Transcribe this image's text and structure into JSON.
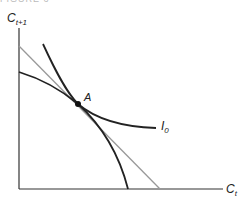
{
  "figure": {
    "header_clipped": "FIGURE 6",
    "axes": {
      "y_label": "C",
      "y_label_sub": "t+1",
      "x_label": "C",
      "x_label_sub": "t"
    },
    "point": {
      "label": "A"
    },
    "indifference_curve": {
      "label": "I",
      "label_sub": "0"
    },
    "colors": {
      "axis": "#333333",
      "budget_line": "#999999",
      "curves": "#222222",
      "point": "#111111"
    }
  }
}
